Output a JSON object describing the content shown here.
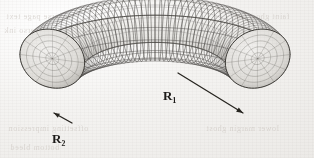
{
  "figure": {
    "type": "torus-wireframe-diagram",
    "caption_visible": false,
    "background_color": "#f2f1ef",
    "ink_color": "#3c3a38",
    "mesh_color": "#4a4845",
    "surface_fill": "#e8e7e4",
    "shadow_color": "#9a9894"
  },
  "labels": {
    "major_radius": {
      "symbol": "R",
      "subscript": "1",
      "text": "R₁"
    },
    "minor_radius": {
      "symbol": "R",
      "subscript": "2",
      "text": "R₂"
    }
  },
  "leaders": {
    "r1_line": {
      "description": "straight leader from inner hole to right tube end",
      "x1": 178,
      "y1": 73,
      "x2": 243,
      "y2": 113
    },
    "r2_line": {
      "description": "short leader across left tube end cap",
      "x1": 54,
      "y1": 113,
      "x2": 72,
      "y2": 123
    }
  },
  "geometry": {
    "center_x": 155,
    "center_y": 72,
    "major_radius_px": 108,
    "minor_radius_px": 34,
    "tilt_ratio": 0.4,
    "open_angle_start_deg": 18,
    "open_angle_end_deg": 162,
    "mesh_u_lines": 52,
    "mesh_v_lines": 16
  },
  "bleedthrough": [
    {
      "id": "b1",
      "text": "reverse page text"
    },
    {
      "id": "b2",
      "text": "faint ghost line"
    },
    {
      "id": "b3",
      "text": "scanned verso ink"
    },
    {
      "id": "b4",
      "text": "show through"
    },
    {
      "id": "b5",
      "text": "offsetting impression"
    },
    {
      "id": "b6",
      "text": "lower margin ghost"
    },
    {
      "id": "b7",
      "text": "bottom bleed"
    }
  ]
}
